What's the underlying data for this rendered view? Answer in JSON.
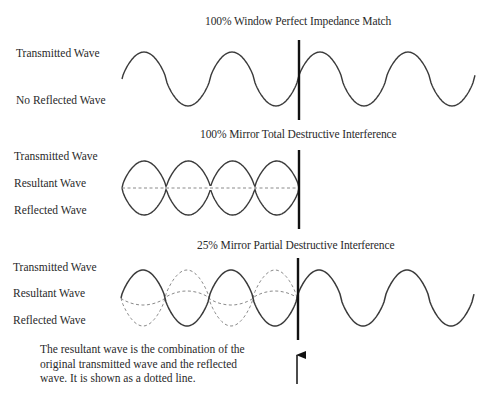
{
  "sections": [
    {
      "title": "100% Window Perfect Impedance Match",
      "labels": [
        "Transmitted Wave",
        "No Reflected Wave"
      ]
    },
    {
      "title": "100% Mirror Total Destructive Interference",
      "labels": [
        "Transmitted Wave",
        "Resultant Wave",
        "Reflected Wave"
      ]
    },
    {
      "title": "25% Mirror Partial Destructive Interference",
      "labels": [
        "Transmitted Wave",
        "Resultant Wave",
        "Reflected Wave"
      ]
    }
  ],
  "caption": {
    "lines": [
      "The resultant wave is the combination of the",
      "original transmitted wave and the reflected",
      "wave. It is shown as a dotted line."
    ]
  },
  "colors": {
    "wave": "#3a3a3a",
    "dashed": "#8a8a8a",
    "boundary": "#111111",
    "text": "#2a2a2a"
  },
  "icons": {
    "boundary_arrow": "up-arrow"
  },
  "waves": {
    "period": 88,
    "section1": {
      "x0": 122,
      "x1": 475,
      "midY": 79,
      "amp": 27,
      "boundaryX": 299,
      "boundaryTop": 40,
      "boundaryBottom": 120
    },
    "section2": {
      "x0": 122,
      "x1": 299,
      "midY": 188,
      "amp": 27,
      "boundaryX": 299,
      "boundaryTop": 150,
      "boundaryBottom": 229
    },
    "section3": {
      "x0": 121,
      "x1": 474,
      "midY": 298,
      "amp": 28,
      "resAmp": 7,
      "dashedEnd": 299,
      "boundaryX": 298,
      "boundaryTop": 258,
      "boundaryBottom": 340
    },
    "arrow": {
      "x": 297,
      "tipY": 355,
      "tailY": 384
    }
  }
}
